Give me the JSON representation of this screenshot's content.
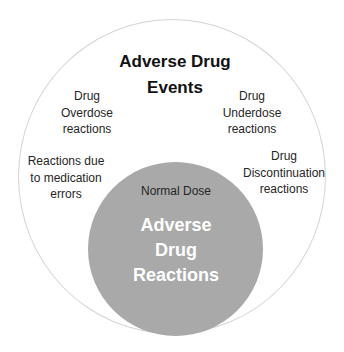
{
  "diagram": {
    "type": "nested-circles",
    "outer_circle": {
      "title_lines": [
        "Adverse Drug",
        "Events"
      ],
      "fill": "#ffffff",
      "stroke": "#d4d4d4",
      "categories": [
        {
          "id": "overdose",
          "lines": [
            "Drug",
            "Overdose",
            "reactions"
          ]
        },
        {
          "id": "underdose",
          "lines": [
            "Drug",
            "Underdose",
            "reactions"
          ]
        },
        {
          "id": "medication-errors",
          "lines": [
            "Reactions due",
            "to medication",
            "errors"
          ]
        },
        {
          "id": "discontinuation",
          "lines": [
            "Drug",
            "Discontinuation",
            "reactions"
          ]
        }
      ]
    },
    "inner_circle": {
      "caption": "Normal Dose",
      "title_lines": [
        "Adverse",
        "Drug",
        "Reactions"
      ],
      "fill": "#a9a9a9",
      "text_color": "#ffffff"
    }
  }
}
